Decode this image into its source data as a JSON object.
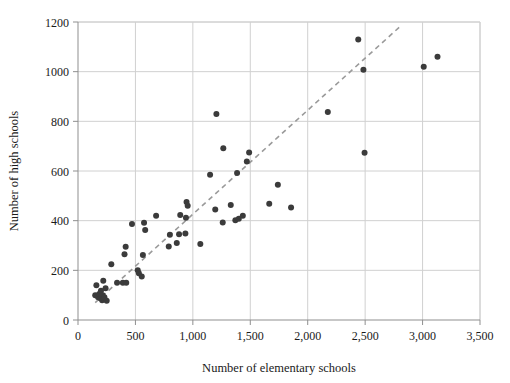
{
  "chart_data": {
    "type": "scatter",
    "title": "",
    "xlabel": "Number of elementary schools",
    "ylabel": "Number of high schools",
    "xlim": [
      0,
      3500
    ],
    "ylim": [
      0,
      1200
    ],
    "xticks": [
      0,
      500,
      1000,
      1500,
      2000,
      2500,
      3000,
      3500
    ],
    "xtick_labels": [
      "0",
      "500",
      "1,000",
      "1,500",
      "2,000",
      "2,500",
      "3,000",
      "3,500"
    ],
    "yticks": [
      0,
      200,
      400,
      600,
      800,
      1000,
      1200
    ],
    "ytick_labels": [
      "0",
      "200",
      "400",
      "600",
      "800",
      "1000",
      "1200"
    ],
    "grid": true,
    "legend": "none",
    "marker_color": "#3b3b3b",
    "marker_size": 6,
    "points": [
      {
        "x": 150,
        "y": 100
      },
      {
        "x": 160,
        "y": 140
      },
      {
        "x": 175,
        "y": 92
      },
      {
        "x": 185,
        "y": 105
      },
      {
        "x": 195,
        "y": 88
      },
      {
        "x": 200,
        "y": 118
      },
      {
        "x": 205,
        "y": 95
      },
      {
        "x": 210,
        "y": 80
      },
      {
        "x": 215,
        "y": 100
      },
      {
        "x": 220,
        "y": 158
      },
      {
        "x": 225,
        "y": 85
      },
      {
        "x": 230,
        "y": 92
      },
      {
        "x": 240,
        "y": 128
      },
      {
        "x": 250,
        "y": 78
      },
      {
        "x": 290,
        "y": 225
      },
      {
        "x": 340,
        "y": 150
      },
      {
        "x": 390,
        "y": 150
      },
      {
        "x": 405,
        "y": 265
      },
      {
        "x": 415,
        "y": 295
      },
      {
        "x": 420,
        "y": 150
      },
      {
        "x": 470,
        "y": 387
      },
      {
        "x": 520,
        "y": 200
      },
      {
        "x": 530,
        "y": 188
      },
      {
        "x": 555,
        "y": 175
      },
      {
        "x": 565,
        "y": 262
      },
      {
        "x": 575,
        "y": 392
      },
      {
        "x": 585,
        "y": 362
      },
      {
        "x": 680,
        "y": 420
      },
      {
        "x": 790,
        "y": 296
      },
      {
        "x": 800,
        "y": 343
      },
      {
        "x": 860,
        "y": 310
      },
      {
        "x": 880,
        "y": 345
      },
      {
        "x": 890,
        "y": 423
      },
      {
        "x": 935,
        "y": 348
      },
      {
        "x": 940,
        "y": 412
      },
      {
        "x": 945,
        "y": 475
      },
      {
        "x": 955,
        "y": 460
      },
      {
        "x": 1065,
        "y": 306
      },
      {
        "x": 1150,
        "y": 585
      },
      {
        "x": 1195,
        "y": 445
      },
      {
        "x": 1205,
        "y": 830
      },
      {
        "x": 1260,
        "y": 393
      },
      {
        "x": 1265,
        "y": 692
      },
      {
        "x": 1330,
        "y": 463
      },
      {
        "x": 1370,
        "y": 402
      },
      {
        "x": 1385,
        "y": 592
      },
      {
        "x": 1400,
        "y": 408
      },
      {
        "x": 1435,
        "y": 420
      },
      {
        "x": 1470,
        "y": 638
      },
      {
        "x": 1490,
        "y": 675
      },
      {
        "x": 1665,
        "y": 468
      },
      {
        "x": 1740,
        "y": 545
      },
      {
        "x": 1855,
        "y": 453
      },
      {
        "x": 2175,
        "y": 838
      },
      {
        "x": 2440,
        "y": 1130
      },
      {
        "x": 2485,
        "y": 1008
      },
      {
        "x": 2495,
        "y": 673
      },
      {
        "x": 3010,
        "y": 1020
      },
      {
        "x": 3130,
        "y": 1060
      }
    ],
    "trendline": {
      "style": "dashed",
      "color": "#9a9a9a",
      "x_start": 150,
      "y_start": 70,
      "x_end": 2800,
      "y_end": 1180
    }
  }
}
